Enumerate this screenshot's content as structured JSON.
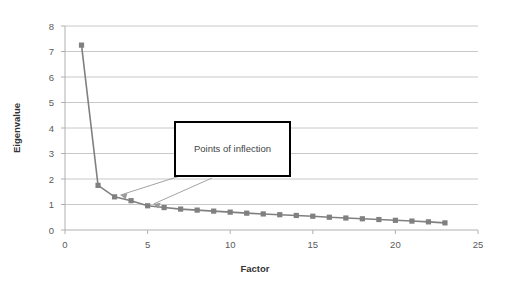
{
  "chart_data": {
    "type": "line",
    "title": "",
    "xlabel": "Factor",
    "ylabel": "Eigenvalue",
    "xlim": [
      0,
      25
    ],
    "ylim": [
      0,
      8
    ],
    "xticks": [
      0,
      5,
      10,
      15,
      20,
      25
    ],
    "yticks": [
      0,
      1,
      2,
      3,
      4,
      5,
      6,
      7,
      8
    ],
    "grid": "horizontal",
    "legend": "none",
    "marker": "square",
    "series_color": "#808080",
    "x": [
      1,
      2,
      3,
      4,
      5,
      6,
      7,
      8,
      9,
      10,
      11,
      12,
      13,
      14,
      15,
      16,
      17,
      18,
      19,
      20,
      21,
      22,
      23
    ],
    "values": [
      7.25,
      1.75,
      1.3,
      1.15,
      0.95,
      0.88,
      0.82,
      0.78,
      0.74,
      0.7,
      0.66,
      0.63,
      0.6,
      0.57,
      0.54,
      0.5,
      0.47,
      0.44,
      0.41,
      0.38,
      0.35,
      0.32,
      0.28
    ],
    "series": [
      {
        "name": "Eigenvalue",
        "values": [
          7.25,
          1.75,
          1.3,
          1.15,
          0.95,
          0.88,
          0.82,
          0.78,
          0.74,
          0.7,
          0.66,
          0.63,
          0.6,
          0.57,
          0.54,
          0.5,
          0.47,
          0.44,
          0.41,
          0.38,
          0.35,
          0.32,
          0.28
        ]
      }
    ],
    "annotations": [
      {
        "label": "Points of inflection",
        "box": true,
        "targets": [
          {
            "x": 3,
            "y": 1.3
          },
          {
            "x": 5,
            "y": 0.95
          }
        ]
      }
    ]
  },
  "axis": {
    "x_tick_labels": [
      "0",
      "5",
      "10",
      "15",
      "20",
      "25"
    ],
    "y_tick_labels": [
      "0",
      "1",
      "2",
      "3",
      "4",
      "5",
      "6",
      "7",
      "8"
    ],
    "x_title": "Factor",
    "y_title": "Eigenvalue"
  },
  "annotation": {
    "label": "Points of inflection"
  },
  "colors": {
    "series": "#808080",
    "gridline": "#c8c8c8",
    "axis": "#b0b0b0",
    "annotation_border": "#000000",
    "tick_text": "#5a5a5a",
    "arrow": "#999999"
  }
}
